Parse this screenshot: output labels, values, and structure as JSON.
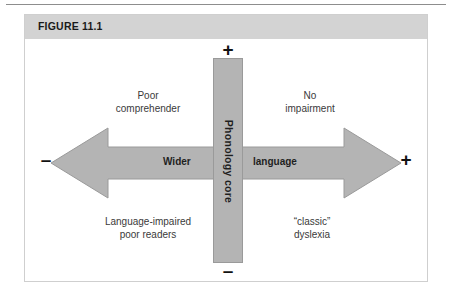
{
  "figure": {
    "title": "FIGURE 11.1",
    "header_color": "#d3d3d3",
    "border_color": "#cfcfcf",
    "shape_fill": "#b4b4b4",
    "shape_stroke": "#9a9a9a"
  },
  "diagram": {
    "vertical_axis": {
      "label": "Phonology core",
      "top_sign": "+",
      "bottom_sign": "–"
    },
    "horizontal_axis": {
      "label_left": "Wider",
      "label_right": "language",
      "left_sign": "–",
      "right_sign": "+"
    },
    "quadrants": [
      {
        "position": "top-left",
        "line1": "Poor",
        "line2": "comprehender"
      },
      {
        "position": "top-right",
        "line1": "No",
        "line2": "impairment"
      },
      {
        "position": "bottom-left",
        "line1": "Language-impaired",
        "line2": "poor readers"
      },
      {
        "position": "bottom-right",
        "line1": "“classic”",
        "line2": "dyslexia"
      }
    ]
  }
}
